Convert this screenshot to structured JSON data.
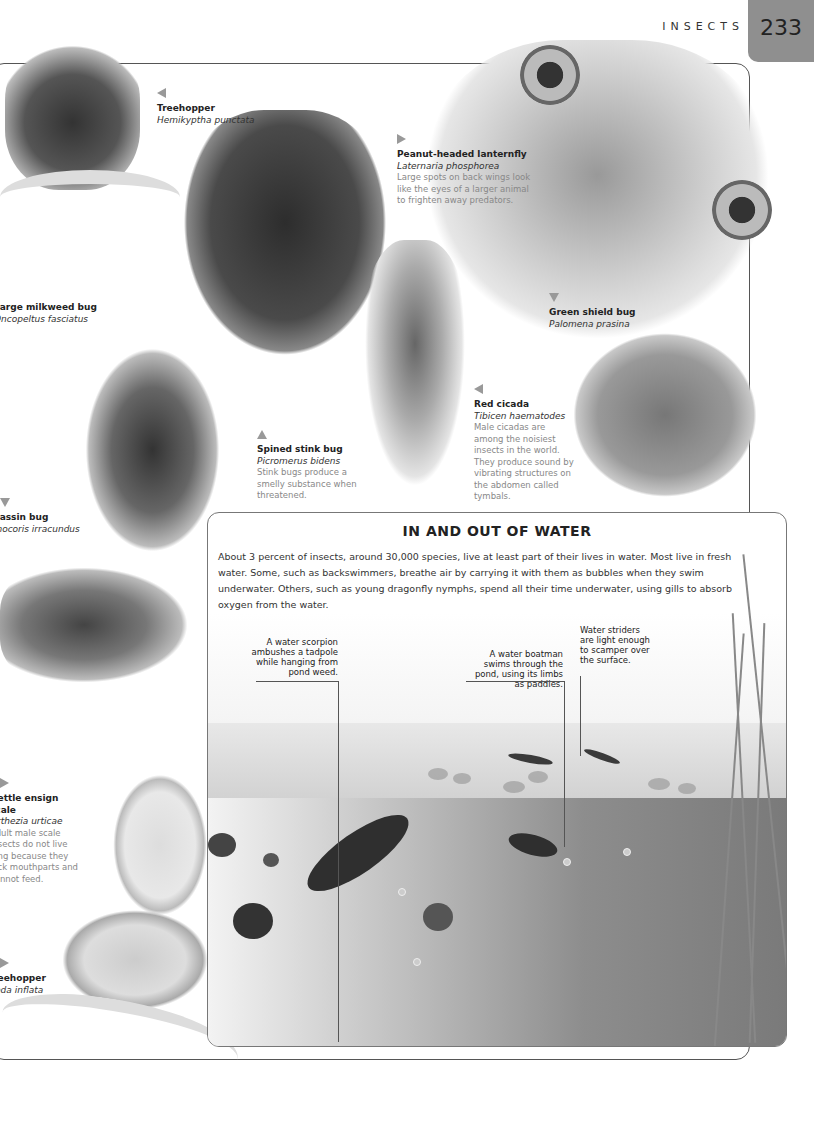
{
  "header": {
    "section": "INSECTS",
    "page_number": "233"
  },
  "species": [
    {
      "common": "Treehopper",
      "scientific": "Hemikyptha punctata",
      "description": "",
      "arrow": "left"
    },
    {
      "common": "Peanut-headed lanternfly",
      "scientific": "Laternaria phosphorea",
      "description": "Large spots on back wings look like the eyes of a larger animal to frighten away predators.",
      "arrow": "right"
    },
    {
      "common": "Large milkweed bug",
      "scientific": "Oncopeltus fasciatus",
      "description": "",
      "arrow": "none"
    },
    {
      "common": "Green shield bug",
      "scientific": "Palomena prasina",
      "description": "",
      "arrow": "down"
    },
    {
      "common": "Red cicada",
      "scientific": "Tibicen haematodes",
      "description": "Male cicadas are among the noisiest insects in the world. They produce sound by vibrating structures on the abdomen called tymbals.",
      "arrow": "left"
    },
    {
      "common": "Spined stink bug",
      "scientific": "Picromerus bidens",
      "description": "Stink bugs produce a smelly substance when threatened.",
      "arrow": "up"
    },
    {
      "common": "Assassin bug",
      "scientific": "Rhinocoris irracundus",
      "description": "",
      "arrow": "down"
    },
    {
      "common": "Nettle ensign scale",
      "scientific": "Orthezia urticae",
      "description": "Adult male scale insects do not live long because they lack mouthparts and cannot feed.",
      "arrow": "right"
    },
    {
      "common": "Treehopper",
      "scientific": "Oeda inflata",
      "description": "",
      "arrow": "right"
    }
  ],
  "feature_panel": {
    "title": "IN AND OUT OF WATER",
    "body": "About 3 percent of insects, around 30,000 species, live at least part of their lives in water. Most live in fresh water. Some, such as backswimmers, breathe air by carrying it with them as bubbles when they swim underwater. Others, such as young dragonfly nymphs, spend all their time underwater, using gills to absorb oxygen from the water.",
    "callouts": [
      {
        "text": "A water scorpion ambushes a tadpole while hanging from pond weed."
      },
      {
        "text": "A water boatman swims through the pond, using its limbs as paddles."
      },
      {
        "text": "Water striders are light enough to scamper over the surface."
      }
    ]
  }
}
